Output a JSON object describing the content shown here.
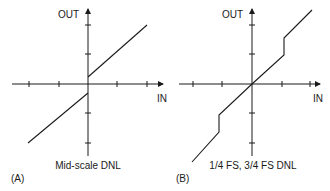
{
  "figure": {
    "colors": {
      "stroke": "#1a1a1a",
      "background": "#ffffff"
    },
    "panels": [
      {
        "id": "A",
        "tag": "(A)",
        "caption": "Mid-scale DNL",
        "y_axis_label": "OUT",
        "x_axis_label": "IN",
        "x_ticks": 4,
        "y_ticks": 4,
        "description": "Transfer function with a step at mid-scale (zero crossing)"
      },
      {
        "id": "B",
        "tag": "(B)",
        "caption": "1/4 FS, 3/4 FS DNL",
        "y_axis_label": "OUT",
        "x_axis_label": "IN",
        "x_ticks": 4,
        "y_ticks": 4,
        "description": "Transfer function with steps at 1/4 and 3/4 full scale"
      }
    ]
  }
}
